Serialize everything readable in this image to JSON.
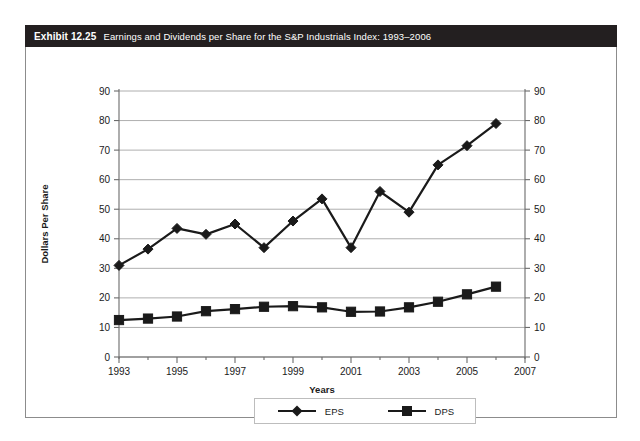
{
  "exhibit": {
    "number": "Exhibit 12.25",
    "caption": "Earnings and Dividends per Share for the S&P Industrials Index: 1993–2006"
  },
  "colors": {
    "title_bar_bg": "#231f20",
    "title_bar_text": "#ffffff",
    "series_color": "#1a1a1a",
    "gridline": "#9a9a9a",
    "axis_line": "#6b6b6b",
    "frame_border": "#8c8c8c",
    "legend_border": "#bdbdbd",
    "page_bg": "#ffffff"
  },
  "legend": {
    "position": "bottom-center",
    "entries": [
      {
        "label": "EPS",
        "marker": "diamond"
      },
      {
        "label": "DPS",
        "marker": "square"
      }
    ]
  },
  "chart_data": {
    "type": "line",
    "title": "Earnings and Dividends per Share for the S&P Industrials Index: 1993–2006",
    "xlabel": "Years",
    "ylabel": "Dollars Per Share",
    "x": [
      1993,
      1994,
      1995,
      1996,
      1997,
      1998,
      1999,
      2000,
      2001,
      2002,
      2003,
      2004,
      2005,
      2006
    ],
    "xlim": [
      1993,
      2007
    ],
    "xticks": [
      1993,
      1995,
      1997,
      1999,
      2001,
      2003,
      2005,
      2007
    ],
    "xtick_labels": [
      "1993",
      "1995",
      "1997",
      "1999",
      "2001",
      "2003",
      "2005",
      "2007"
    ],
    "x_minor_ticks": [
      1994,
      1996,
      1998,
      2000,
      2002,
      2004,
      2006
    ],
    "ylim": [
      0,
      90
    ],
    "yticks": [
      0,
      10,
      20,
      30,
      40,
      50,
      60,
      70,
      80,
      90
    ],
    "ytick_labels": [
      "0",
      "10",
      "20",
      "30",
      "40",
      "50",
      "60",
      "70",
      "80",
      "90"
    ],
    "y_right_axis": true,
    "y_right_ticks": [
      0,
      10,
      20,
      30,
      40,
      50,
      60,
      70,
      80,
      90
    ],
    "y_right_tick_labels": [
      "0",
      "10",
      "20",
      "30",
      "40",
      "50",
      "60",
      "70",
      "80",
      "90"
    ],
    "grid": true,
    "grid_axis": "y",
    "legend": [
      "EPS",
      "DPS"
    ],
    "series": [
      {
        "name": "EPS",
        "marker": "diamond",
        "values": [
          31.0,
          36.5,
          43.5,
          41.5,
          45.0,
          37.0,
          46.0,
          53.5,
          37.0,
          56.0,
          49.0,
          65.0,
          71.5,
          79.0
        ]
      },
      {
        "name": "DPS",
        "marker": "square",
        "values": [
          12.5,
          13.0,
          13.7,
          15.5,
          16.2,
          17.0,
          17.2,
          16.8,
          15.3,
          15.4,
          16.8,
          18.7,
          21.2,
          23.8
        ]
      }
    ]
  }
}
